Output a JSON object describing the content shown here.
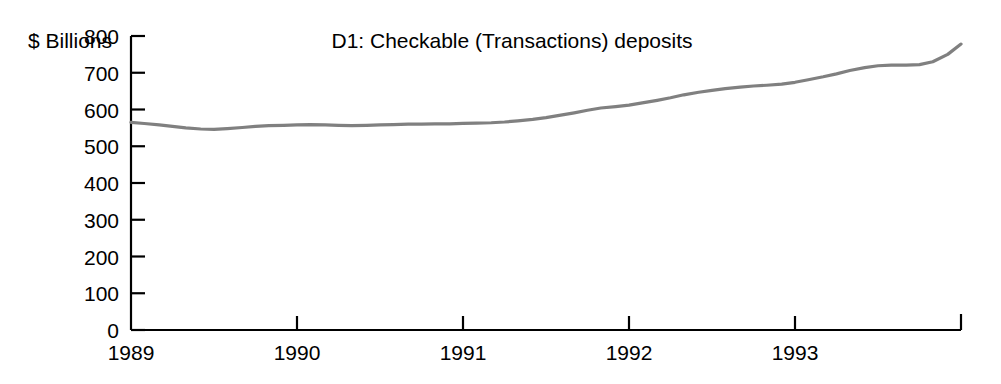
{
  "chart_data": {
    "type": "line",
    "title": "D1: Checkable (Transactions) deposits",
    "ylabel": "$ Billions",
    "xlabel": "",
    "ylim": [
      0,
      800
    ],
    "xlim": [
      1989,
      1994
    ],
    "grid": false,
    "legend": null,
    "y_ticks": [
      800,
      700,
      600,
      500,
      400,
      300,
      200,
      100,
      0
    ],
    "x_ticks": [
      1989,
      1990,
      1991,
      1992,
      1993
    ],
    "x_tick_labels": [
      "1989",
      "1990",
      "1991",
      "1992",
      "1993"
    ],
    "y_tick_labels": [
      "800",
      "700",
      "600",
      "500",
      "400",
      "300",
      "200",
      "100",
      "0"
    ],
    "series": [
      {
        "name": "D1: Checkable (Transactions) deposits",
        "color": "#808080",
        "x": [
          1989.0,
          1989.08,
          1989.17,
          1989.25,
          1989.33,
          1989.42,
          1989.5,
          1989.58,
          1989.67,
          1989.75,
          1989.83,
          1989.92,
          1990.0,
          1990.08,
          1990.17,
          1990.25,
          1990.33,
          1990.42,
          1990.5,
          1990.58,
          1990.67,
          1990.75,
          1990.83,
          1990.92,
          1991.0,
          1991.08,
          1991.17,
          1991.25,
          1991.33,
          1991.42,
          1991.5,
          1991.58,
          1991.67,
          1991.75,
          1991.83,
          1991.92,
          1992.0,
          1992.08,
          1992.17,
          1992.25,
          1992.33,
          1992.42,
          1992.5,
          1992.58,
          1992.67,
          1992.75,
          1992.83,
          1992.92,
          1993.0,
          1993.08,
          1993.17,
          1993.25,
          1993.33,
          1993.42,
          1993.5,
          1993.58,
          1993.67,
          1993.75,
          1993.83,
          1993.92,
          1994.0
        ],
        "y": [
          565,
          562,
          558,
          554,
          550,
          547,
          546,
          548,
          551,
          554,
          556,
          557,
          558,
          559,
          558,
          557,
          556,
          557,
          558,
          559,
          560,
          560,
          561,
          561,
          562,
          563,
          564,
          566,
          569,
          573,
          578,
          584,
          591,
          598,
          604,
          608,
          612,
          618,
          625,
          632,
          640,
          647,
          652,
          657,
          661,
          664,
          666,
          669,
          674,
          681,
          689,
          697,
          706,
          714,
          719,
          721,
          721,
          722,
          730,
          750,
          778
        ]
      }
    ],
    "annotations": []
  },
  "chart_meta": {
    "title_color": "#000000",
    "axis_color": "#000000",
    "background": "#ffffff",
    "line_color": "#808080"
  }
}
